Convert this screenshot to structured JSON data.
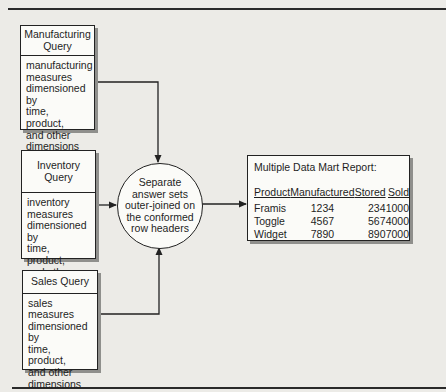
{
  "diagram": {
    "queries": [
      {
        "title": "Manufacturing\nQuery",
        "body": "manufacturing\nmeasures\ndimensioned by\ntime,\nproduct,\nand other\ndimensions"
      },
      {
        "title": "Inventory Query",
        "body": "inventory\nmeasures\ndimensioned by\ntime,\nproduct,\nand other\ndimensions"
      },
      {
        "title": "Sales Query",
        "body": "sales\nmeasures\ndimensioned by\ntime,\nproduct,\nand other\ndimensions"
      }
    ],
    "process": {
      "label": "Separate\nanswer sets\nouter-joined on\nthe conformed\nrow headers"
    },
    "report": {
      "title": "Multiple Data Mart Report:",
      "columns": [
        "Product",
        "Manufactured",
        "Stored",
        "Sold"
      ],
      "rows": [
        [
          "Framis",
          "1234",
          "234",
          "1000"
        ],
        [
          "Toggle",
          "4567",
          "567",
          "4000"
        ],
        [
          "Widget",
          "7890",
          "890",
          "7000"
        ]
      ]
    },
    "colors": {
      "background": "#ecebe7",
      "box_fill": "#fbfbf8",
      "line": "#222222",
      "shadow": "#8f8f8c"
    }
  }
}
